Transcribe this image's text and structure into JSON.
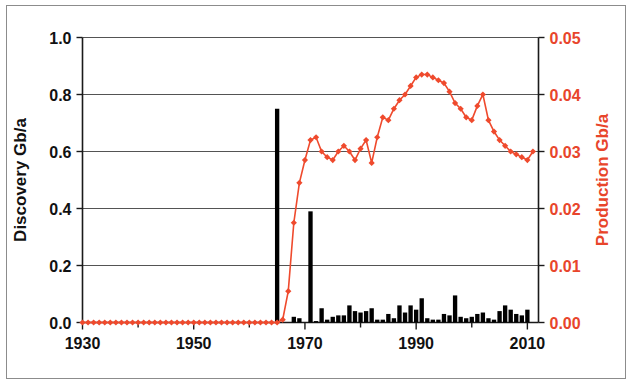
{
  "figure": {
    "width": 635,
    "height": 387,
    "background": "#ffffff",
    "border_color": "#8c8c8c"
  },
  "colors": {
    "discovery": "#000000",
    "production": "#ef4a2d",
    "production_text": "#e8452b",
    "axis": "#1a1a1a",
    "grid": "#545454"
  },
  "chart_data": {
    "type": "bar",
    "title": "",
    "subtitle": "",
    "xlabel": "",
    "ylabel": "Discovery Gb/a",
    "y2label": "Production Gb/a",
    "xlim": [
      1930,
      2012
    ],
    "ylim": [
      0.0,
      1.0
    ],
    "y2lim": [
      0.0,
      0.05
    ],
    "grid": true,
    "legend": "none",
    "xticks": [
      1930,
      1950,
      1970,
      1990,
      2010
    ],
    "xtick_labels": [
      "1930",
      "1950",
      "1970",
      "1990",
      "2010"
    ],
    "xticks_minor": [
      1940,
      1960,
      1980,
      2000
    ],
    "yticks": [
      0.0,
      0.2,
      0.4,
      0.6,
      0.8,
      1.0
    ],
    "ytick_labels": [
      "0.0",
      "0.2",
      "0.4",
      "0.6",
      "0.8",
      "1.0"
    ],
    "y2ticks": [
      0.0,
      0.01,
      0.02,
      0.03,
      0.04,
      0.05
    ],
    "y2tick_labels": [
      "0.00",
      "0.01",
      "0.02",
      "0.03",
      "0.04",
      "0.05"
    ],
    "series": [
      {
        "name": "Discovery Gb/a",
        "type": "bar",
        "axis": "left",
        "color": "#000000",
        "x": [
          1930,
          1931,
          1932,
          1933,
          1934,
          1935,
          1936,
          1937,
          1938,
          1939,
          1940,
          1941,
          1942,
          1943,
          1944,
          1945,
          1946,
          1947,
          1948,
          1949,
          1950,
          1951,
          1952,
          1953,
          1954,
          1955,
          1956,
          1957,
          1958,
          1959,
          1960,
          1961,
          1962,
          1963,
          1964,
          1965,
          1966,
          1967,
          1968,
          1969,
          1970,
          1971,
          1972,
          1973,
          1974,
          1975,
          1976,
          1977,
          1978,
          1979,
          1980,
          1981,
          1982,
          1983,
          1984,
          1985,
          1986,
          1987,
          1988,
          1989,
          1990,
          1991,
          1992,
          1993,
          1994,
          1995,
          1996,
          1997,
          1998,
          1999,
          2000,
          2001,
          2002,
          2003,
          2004,
          2005,
          2006,
          2007,
          2008,
          2009,
          2010,
          2011
        ],
        "values": [
          0,
          0,
          0,
          0,
          0,
          0,
          0,
          0,
          0,
          0,
          0,
          0,
          0,
          0,
          0,
          0,
          0,
          0,
          0,
          0,
          0,
          0,
          0,
          0,
          0,
          0,
          0,
          0,
          0,
          0,
          0,
          0,
          0,
          0,
          0,
          0.75,
          0,
          0,
          0.02,
          0.015,
          0,
          0.39,
          0.005,
          0.05,
          0.01,
          0.02,
          0.025,
          0.025,
          0.06,
          0.04,
          0.035,
          0.04,
          0.05,
          0.01,
          0.01,
          0.03,
          0.015,
          0.06,
          0.035,
          0.06,
          0.045,
          0.085,
          0.015,
          0.01,
          0.01,
          0.03,
          0.025,
          0.095,
          0.02,
          0.015,
          0.02,
          0.03,
          0.035,
          0.015,
          0.01,
          0.04,
          0.06,
          0.045,
          0.03,
          0.025,
          0.045,
          0.0
        ]
      },
      {
        "name": "Production Gb/a",
        "type": "line",
        "axis": "right",
        "color": "#ef4a2d",
        "marker": "diamond",
        "x": [
          1930,
          1931,
          1932,
          1933,
          1934,
          1935,
          1936,
          1937,
          1938,
          1939,
          1940,
          1941,
          1942,
          1943,
          1944,
          1945,
          1946,
          1947,
          1948,
          1949,
          1950,
          1951,
          1952,
          1953,
          1954,
          1955,
          1956,
          1957,
          1958,
          1959,
          1960,
          1961,
          1962,
          1963,
          1964,
          1965,
          1966,
          1967,
          1968,
          1969,
          1970,
          1971,
          1972,
          1973,
          1974,
          1975,
          1976,
          1977,
          1978,
          1979,
          1980,
          1981,
          1982,
          1983,
          1984,
          1985,
          1986,
          1987,
          1988,
          1989,
          1990,
          1991,
          1992,
          1993,
          1994,
          1995,
          1996,
          1997,
          1998,
          1999,
          2000,
          2001,
          2002,
          2003,
          2004,
          2005,
          2006,
          2007,
          2008,
          2009,
          2010,
          2011
        ],
        "values": [
          0,
          0,
          0,
          0,
          0,
          0,
          0,
          0,
          0,
          0,
          0,
          0,
          0,
          0,
          0,
          0,
          0,
          0,
          0,
          0,
          0,
          0,
          0,
          0,
          0,
          0,
          0,
          0,
          0,
          0,
          0,
          0,
          0,
          0,
          0,
          0,
          0.0005,
          0.0055,
          0.0175,
          0.0245,
          0.0285,
          0.032,
          0.0325,
          0.03,
          0.029,
          0.0285,
          0.03,
          0.031,
          0.03,
          0.0285,
          0.0305,
          0.032,
          0.028,
          0.0325,
          0.036,
          0.0355,
          0.0375,
          0.039,
          0.04,
          0.0415,
          0.043,
          0.0435,
          0.0435,
          0.043,
          0.0425,
          0.042,
          0.0405,
          0.0385,
          0.0375,
          0.036,
          0.0355,
          0.038,
          0.04,
          0.0355,
          0.0335,
          0.032,
          0.031,
          0.03,
          0.0295,
          0.029,
          0.0285,
          0.03
        ]
      }
    ]
  },
  "annotations": []
}
